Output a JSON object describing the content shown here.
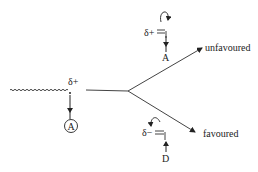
{
  "diagram": {
    "type": "reaction-selectivity-scheme",
    "colors": {
      "ink": "#222222",
      "background": "#ffffff"
    },
    "left_fragment": {
      "charge_label": "δ+",
      "attacking_group": "A"
    },
    "branches": [
      {
        "direction": "up",
        "outcome": "unfavoured",
        "charge_label": "δ+",
        "group": "A"
      },
      {
        "direction": "down",
        "outcome": "favoured",
        "charge_label": "δ−",
        "group": "D"
      }
    ]
  }
}
